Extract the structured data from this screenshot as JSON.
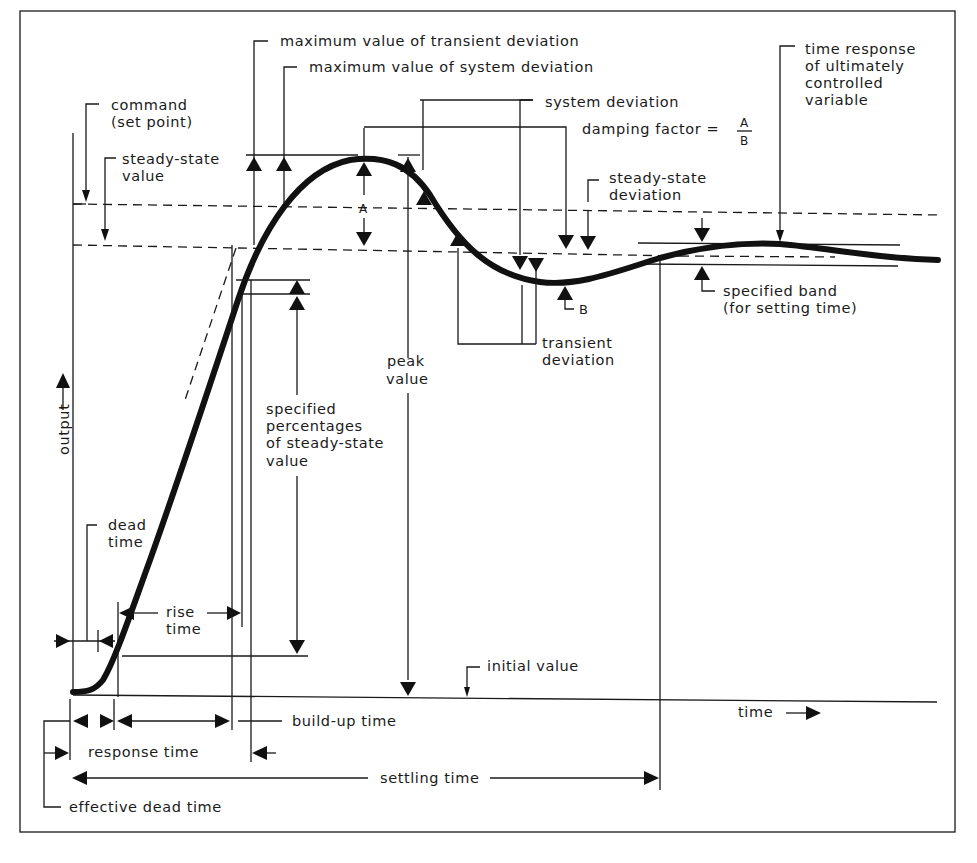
{
  "diagram": {
    "axes": {
      "y_label": "output",
      "x_label": "time"
    },
    "labels": {
      "max_transient_deviation": "maximum value of transient deviation",
      "max_system_deviation": "maximum value of system deviation",
      "command_line1": "command",
      "command_line2": "(set point)",
      "steady_state_value_line1": "steady-state",
      "steady_state_value_line2": "value",
      "system_deviation": "system deviation",
      "damping_factor": "damping factor =",
      "damping_num": "A",
      "damping_den": "B",
      "steady_state_deviation_line1": "steady-state",
      "steady_state_deviation_line2": "deviation",
      "time_response_line1": "time response",
      "time_response_line2": "of ultimately",
      "time_response_line3": "controlled",
      "time_response_line4": "variable",
      "A": "A",
      "B": "B",
      "specified_band_line1": "specified band",
      "specified_band_line2": "(for setting time)",
      "transient_deviation_line1": "transient",
      "transient_deviation_line2": "deviation",
      "peak_value_line1": "peak",
      "peak_value_line2": "value",
      "specified_pct_line1": "specified",
      "specified_pct_line2": "percentages",
      "specified_pct_line3": "of steady-state",
      "specified_pct_line4": "value",
      "dead_time_line1": "dead",
      "dead_time_line2": "time",
      "rise_time_line1": "rise",
      "rise_time_line2": "time",
      "initial_value": "initial value",
      "build_up_time": "build-up time",
      "response_time": "response time",
      "settling_time": "settling time",
      "effective_dead_time": "effective dead time"
    }
  }
}
